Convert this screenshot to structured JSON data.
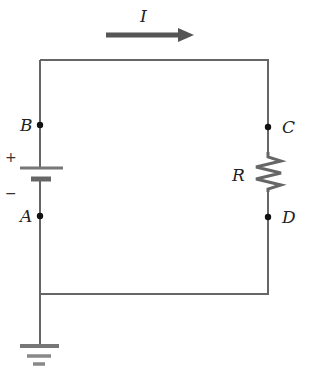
{
  "diagram": {
    "type": "circuit",
    "current": {
      "label": "I",
      "direction": "right"
    },
    "nodes": [
      {
        "id": "B",
        "label": "B"
      },
      {
        "id": "A",
        "label": "A"
      },
      {
        "id": "C",
        "label": "C"
      },
      {
        "id": "D",
        "label": "D"
      }
    ],
    "battery": {
      "plus": "+",
      "minus": "−"
    },
    "resistor": {
      "label": "R"
    },
    "ground": true,
    "colors": {
      "wire": "#666666",
      "arrow": "#555555",
      "resistor": "#666666",
      "text": "#222222"
    }
  }
}
